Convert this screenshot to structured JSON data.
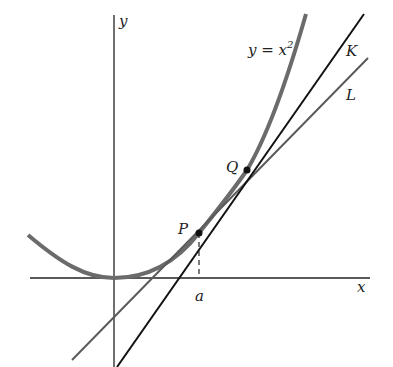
{
  "diagram": {
    "labels": {
      "y_axis": "y",
      "x_axis": "x",
      "curve": "y = x",
      "curve_exponent": "2",
      "line_k": "K",
      "line_l": "L",
      "point_p": "P",
      "point_q": "Q",
      "tick_a": "a"
    },
    "colors": {
      "axes": "#222222",
      "curve": "#6b6b6b",
      "line_k": "#111111",
      "line_l": "#5a5a5a",
      "points": "#111111"
    }
  }
}
